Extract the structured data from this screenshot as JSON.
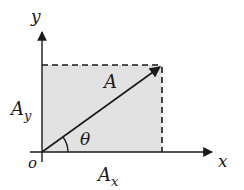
{
  "diagram": {
    "type": "vector-components",
    "colors": {
      "stroke": "#1a1a1a",
      "fill": "#e2e2e2",
      "background": "#ffffff"
    },
    "labels": {
      "y_axis": "y",
      "x_axis": "x",
      "origin": "o",
      "vector": "A",
      "y_component": "A",
      "y_component_sub": "y",
      "x_component": "A",
      "x_component_sub": "x",
      "angle": "θ"
    }
  }
}
